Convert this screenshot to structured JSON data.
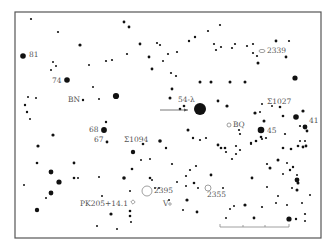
{
  "chart_title": "Star finder chart",
  "frame": {
    "x": 15,
    "y": 12,
    "w": 306,
    "h": 226
  },
  "labels": [
    {
      "id": "81",
      "text": "81",
      "x": 29,
      "y": 57
    },
    {
      "id": "74",
      "text": "74",
      "x": 52,
      "y": 83
    },
    {
      "id": "bn",
      "text": "BN",
      "x": 68,
      "y": 102
    },
    {
      "id": "54-lambda",
      "text": "54-λ",
      "x": 178,
      "y": 102
    },
    {
      "id": "68",
      "text": "68",
      "x": 89,
      "y": 132
    },
    {
      "id": "67",
      "text": "67",
      "x": 94,
      "y": 142
    },
    {
      "id": "sigma1094",
      "text": "Σ1094",
      "x": 124,
      "y": 142
    },
    {
      "id": "bq",
      "text": "BQ",
      "x": 233,
      "y": 127
    },
    {
      "id": "45",
      "text": "45",
      "x": 267,
      "y": 133
    },
    {
      "id": "sigma1027",
      "text": "Σ1027",
      "x": 267,
      "y": 104
    },
    {
      "id": "41",
      "text": "41",
      "x": 309,
      "y": 123
    },
    {
      "id": "2339",
      "text": "2339",
      "x": 267,
      "y": 53
    },
    {
      "id": "pk205",
      "text": "PK205+14.1",
      "x": 80,
      "y": 206
    },
    {
      "id": "2395",
      "text": "2395",
      "x": 154,
      "y": 193
    },
    {
      "id": "v",
      "text": "V",
      "x": 163,
      "y": 206
    },
    {
      "id": "2355",
      "text": "2355",
      "x": 207,
      "y": 197
    }
  ],
  "objects": [
    {
      "id": "2339-galaxy",
      "type": "ellipse",
      "x": 262,
      "y": 51,
      "rx": 3,
      "ry": 1.6
    },
    {
      "id": "bq-circle",
      "type": "circle",
      "x": 229,
      "y": 125,
      "r": 2
    },
    {
      "id": "2395-cluster",
      "type": "circle",
      "x": 147,
      "y": 191,
      "r": 5
    },
    {
      "id": "2355-cluster",
      "type": "circle",
      "x": 208,
      "y": 188,
      "r": 3
    },
    {
      "id": "pk205-nebula",
      "type": "diamond",
      "x": 133,
      "y": 202,
      "r": 2.2
    },
    {
      "id": "v-circle",
      "type": "circle",
      "x": 170,
      "y": 204,
      "r": 1.2
    }
  ],
  "arrow": {
    "x1": 160,
    "y1": 110,
    "x2": 188,
    "y2": 110
  },
  "scale_bar": {
    "x1": 220,
    "y1": 227,
    "x2": 289,
    "y2": 227,
    "ticks": [
      243,
      265
    ]
  },
  "stars": [
    [
      31,
      19,
      1.1
    ],
    [
      58,
      32,
      1.1
    ],
    [
      80,
      45,
      1.6
    ],
    [
      124,
      22,
      1.4
    ],
    [
      129,
      27,
      1.4
    ],
    [
      140,
      44,
      1.4
    ],
    [
      157,
      43,
      1.1
    ],
    [
      160,
      45,
      1.1
    ],
    [
      168,
      54,
      1.1
    ],
    [
      177,
      52,
      1.1
    ],
    [
      127,
      54,
      1.1
    ],
    [
      149,
      57,
      1.4
    ],
    [
      152,
      69,
      1.4
    ],
    [
      163,
      61,
      1.0
    ],
    [
      23,
      56,
      2.8
    ],
    [
      53,
      62,
      1.0
    ],
    [
      56,
      66,
      1.0
    ],
    [
      51,
      70,
      1.0
    ],
    [
      67,
      80,
      2.8
    ],
    [
      89,
      65,
      1.0
    ],
    [
      106,
      61,
      1.1
    ],
    [
      112,
      60,
      1.1
    ],
    [
      93,
      87,
      1.0
    ],
    [
      99,
      99,
      1.0
    ],
    [
      116,
      96,
      3.1
    ],
    [
      83,
      100,
      1.2
    ],
    [
      28,
      97,
      1.0
    ],
    [
      36,
      98,
      1.0
    ],
    [
      25,
      105,
      1.2
    ],
    [
      27,
      112,
      1.2
    ],
    [
      30,
      119,
      1.0
    ],
    [
      53,
      135,
      1.6
    ],
    [
      38,
      146,
      1.6
    ],
    [
      106,
      122,
      1.2
    ],
    [
      104,
      130,
      2.9
    ],
    [
      107,
      142,
      1.4
    ],
    [
      133,
      152,
      2.2
    ],
    [
      143,
      144,
      1.3
    ],
    [
      160,
      141,
      1.8
    ],
    [
      141,
      160,
      1.0
    ],
    [
      150,
      159,
      1.0
    ],
    [
      132,
      169,
      1.3
    ],
    [
      150,
      178,
      1.3
    ],
    [
      152,
      180,
      1.0
    ],
    [
      124,
      178,
      1.8
    ],
    [
      74,
      163,
      1.4
    ],
    [
      51,
      172,
      2.4
    ],
    [
      37,
      163,
      1.3
    ],
    [
      24,
      185,
      1.0
    ],
    [
      51,
      193,
      2.4
    ],
    [
      59,
      182,
      2.6
    ],
    [
      46,
      198,
      1.0
    ],
    [
      74,
      178,
      1.3
    ],
    [
      78,
      178,
      1.0
    ],
    [
      99,
      177,
      1.0
    ],
    [
      102,
      196,
      1.0
    ],
    [
      130,
      191,
      1.0
    ],
    [
      37,
      210,
      2.2
    ],
    [
      97,
      226,
      1.0
    ],
    [
      111,
      214,
      1.6
    ],
    [
      130,
      211,
      1.3
    ],
    [
      130,
      216,
      1.3
    ],
    [
      117,
      229,
      1.0
    ],
    [
      131,
      222,
      1.0
    ],
    [
      155,
      188,
      1.0
    ],
    [
      159,
      188,
      1.0
    ],
    [
      177,
      182,
      1.0
    ],
    [
      186,
      186,
      1.0
    ],
    [
      194,
      183,
      1.3
    ],
    [
      198,
      188,
      1.0
    ],
    [
      169,
      200,
      1.0
    ],
    [
      187,
      200,
      1.6
    ],
    [
      183,
      210,
      1.0
    ],
    [
      223,
      188,
      1.0
    ],
    [
      197,
      212,
      1.4
    ],
    [
      189,
      41,
      1.2
    ],
    [
      195,
      37,
      1.2
    ],
    [
      208,
      31,
      1.1
    ],
    [
      220,
      25,
      1.1
    ],
    [
      221,
      47,
      1.1
    ],
    [
      214,
      44,
      1.1
    ],
    [
      216,
      50,
      1.1
    ],
    [
      235,
      44,
      1.1
    ],
    [
      232,
      48,
      1.1
    ],
    [
      247,
      46,
      1.1
    ],
    [
      253,
      44,
      1.1
    ],
    [
      257,
      56,
      1.1
    ],
    [
      258,
      63,
      1.5
    ],
    [
      253,
      53,
      1.1
    ],
    [
      276,
      41,
      1.4
    ],
    [
      289,
      41,
      1.1
    ],
    [
      286,
      57,
      1.4
    ],
    [
      171,
      73,
      1.1
    ],
    [
      176,
      76,
      1.1
    ],
    [
      172,
      89,
      1.4
    ],
    [
      200,
      82,
      1.5
    ],
    [
      211,
      82,
      1.5
    ],
    [
      230,
      82,
      1.5
    ],
    [
      245,
      82,
      1.5
    ],
    [
      295,
      78,
      2.6
    ],
    [
      170,
      98,
      1.5
    ],
    [
      180,
      109,
      1.3
    ],
    [
      184,
      106,
      1.3
    ],
    [
      200,
      109,
      6.0
    ],
    [
      218,
      101,
      1.4
    ],
    [
      227,
      106,
      1.6
    ],
    [
      255,
      113,
      1.6
    ],
    [
      260,
      112,
      1.0
    ],
    [
      262,
      104,
      1.0
    ],
    [
      272,
      106,
      1.0
    ],
    [
      280,
      107,
      1.3
    ],
    [
      283,
      116,
      1.3
    ],
    [
      303,
      111,
      1.6
    ],
    [
      296,
      117,
      2.8
    ],
    [
      300,
      126,
      1.1
    ],
    [
      305,
      127,
      2.4
    ],
    [
      307,
      131,
      1.4
    ],
    [
      264,
      121,
      1.5
    ],
    [
      261,
      130,
      3.3
    ],
    [
      261,
      137,
      1.3
    ],
    [
      256,
      141,
      1.3
    ],
    [
      262,
      139,
      1.1
    ],
    [
      266,
      138,
      1.1
    ],
    [
      240,
      134,
      1.1
    ],
    [
      239,
      130,
      1.1
    ],
    [
      188,
      130,
      1.5
    ],
    [
      193,
      138,
      1.2
    ],
    [
      200,
      140,
      1.1
    ],
    [
      218,
      145,
      1.4
    ],
    [
      206,
      138,
      1.1
    ],
    [
      236,
      146,
      1.1
    ],
    [
      251,
      144,
      1.1
    ],
    [
      285,
      134,
      1.1
    ],
    [
      298,
      146,
      1.3
    ],
    [
      306,
      146,
      1.4
    ],
    [
      291,
      149,
      1.3
    ],
    [
      283,
      148,
      1.3
    ],
    [
      221,
      148,
      1.3
    ],
    [
      225,
      148,
      1.3
    ],
    [
      226,
      152,
      1.1
    ],
    [
      232,
      159,
      1.1
    ],
    [
      236,
      154,
      1.1
    ],
    [
      240,
      150,
      1.1
    ],
    [
      251,
      143,
      1.2
    ],
    [
      303,
      147,
      1.4
    ],
    [
      300,
      141,
      1.0
    ],
    [
      305,
      141,
      1.0
    ],
    [
      267,
      164,
      1.1
    ],
    [
      270,
      168,
      1.5
    ],
    [
      278,
      160,
      1.5
    ],
    [
      287,
      163,
      1.0
    ],
    [
      293,
      167,
      1.2
    ],
    [
      290,
      170,
      1.2
    ],
    [
      297,
      175,
      1.0
    ],
    [
      283,
      174,
      1.0
    ],
    [
      298,
      183,
      1.5
    ],
    [
      297,
      190,
      1.5
    ],
    [
      292,
      188,
      1.0
    ],
    [
      267,
      187,
      1.0
    ],
    [
      278,
      196,
      1.0
    ],
    [
      287,
      205,
      1.0
    ],
    [
      302,
      203,
      1.0
    ],
    [
      310,
      195,
      1.0
    ],
    [
      297,
      180,
      2.4
    ],
    [
      276,
      203,
      1.0
    ],
    [
      245,
      205,
      1.6
    ],
    [
      230,
      209,
      1.0
    ],
    [
      252,
      178,
      1.4
    ],
    [
      234,
      206,
      1.0
    ],
    [
      226,
      218,
      1.0
    ],
    [
      254,
      218,
      1.4
    ],
    [
      262,
      207,
      1.1
    ],
    [
      289,
      219,
      2.6
    ],
    [
      296,
      219,
      1.2
    ],
    [
      305,
      214,
      1.1
    ],
    [
      305,
      221,
      1.0
    ],
    [
      172,
      164,
      1.1
    ],
    [
      190,
      170,
      1.1
    ],
    [
      211,
      175,
      1.4
    ],
    [
      196,
      166,
      1.1
    ],
    [
      166,
      148,
      1.2
    ],
    [
      186,
      176,
      1.1
    ]
  ]
}
